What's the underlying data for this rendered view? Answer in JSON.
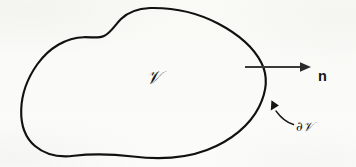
{
  "figure": {
    "kind": "math-diagram",
    "background_color": "#fbfbf9",
    "stroke_color": "#111110",
    "arrow_color": "#3a3a3a",
    "canvas": {
      "width": 356,
      "height": 167
    }
  },
  "labels": {
    "volume": "𝒱",
    "volume_plain": "V",
    "boundary_partial": "∂",
    "boundary_volume": "𝒱",
    "boundary_plain": "∂V",
    "normal": "n"
  },
  "annotations": {
    "normal_arrow": {
      "name": "outward-normal-arrow",
      "from": [
        245,
        67
      ],
      "to": [
        311,
        67
      ],
      "tip_x": 311,
      "tip_y": 67
    },
    "boundary_leader": {
      "name": "boundary-leader-arrow",
      "points_to": [
        270,
        100
      ],
      "from": [
        294,
        124
      ]
    }
  },
  "geometry": {
    "region_path": "M 150.0 8.0 C 176 7.4 199 13.5 218 23.5 C 238 34 254 48 261.5 63 C 268 76 266.5 92 259 107 C 250 125 231 141 207 150 C 183 159 157 159.5 133 156.5 C 112 154 92 153.5 74 155.8 C 59 157.6 45 154.5 35 146 C 25.5 138 20.8 125 21.2 110 C 21.6 94 27.5 78 37.5 64 C 49 48 66 37.5 84 37.2 C 93 37.1 98.5 38.5 104 36 C 111 32.8 114.5 25.5 121 19 C 128.5 11.5 138.5 8.6 150.0 8.0 Z",
    "extremes": {
      "top": [
        150,
        8
      ],
      "right": [
        265,
        70
      ],
      "bottom": [
        110,
        157
      ],
      "left": [
        21,
        107
      ]
    },
    "inflection_dimple": [
      98,
      37
    ]
  }
}
